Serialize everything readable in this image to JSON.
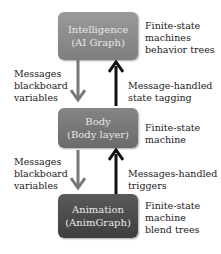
{
  "boxes": {
    "intelligence": {
      "line1": "Intelligence",
      "line2": "(AI Graph)",
      "color": "#8a8a8a"
    },
    "body": {
      "line1": "Body",
      "line2": "(Body layer)",
      "color": "#777777"
    },
    "animation": {
      "line1": "Animation",
      "line2": "(AnimGraph)",
      "color": "#4a4a4a"
    }
  },
  "side_labels": {
    "intelligence": [
      "Finite-state",
      "machines",
      "behavior trees"
    ],
    "body": [
      "Finite-state",
      "machine"
    ],
    "animation": [
      "Finite-state",
      "machine",
      "blend trees"
    ]
  },
  "edges": {
    "intel_to_body": {
      "lines": [
        "Messages",
        "blackboard",
        "variables"
      ],
      "color": "#777777"
    },
    "body_to_intel": {
      "lines": [
        "Message-handled",
        "state tagging"
      ],
      "color": "#111111"
    },
    "body_to_anim": {
      "lines": [
        "Messages",
        "blackboard",
        "variables"
      ],
      "color": "#777777"
    },
    "anim_to_body": {
      "lines": [
        "Messages-handled",
        "triggers"
      ],
      "color": "#111111"
    }
  }
}
